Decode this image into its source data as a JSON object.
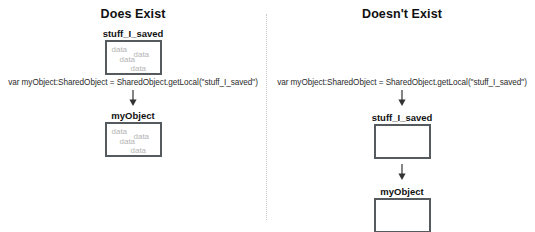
{
  "diagram": {
    "type": "flow-diagram",
    "divider": "vertical-dotted-line",
    "columns": [
      {
        "id": "does-exist",
        "title": "Does Exist",
        "code_line": "var myObject:SharedObject = SharedObject.getLocal(\"stuff_I_saved\")",
        "arrows": 1,
        "nodes": [
          {
            "label": "stuff_I_saved",
            "filled": true,
            "contents": [
              "data",
              "data",
              "data",
              "data"
            ]
          },
          {
            "label": "myObject",
            "filled": true,
            "contents": [
              "data",
              "data",
              "data",
              "data"
            ]
          }
        ]
      },
      {
        "id": "doesnt-exist",
        "title": "Doesn't Exist",
        "code_line": "var myObject:SharedObject = SharedObject.getLocal(\"stuff_I_saved\")",
        "arrows": 2,
        "nodes": [
          {
            "label": "stuff_I_saved",
            "filled": false,
            "contents": []
          },
          {
            "label": "myObject",
            "filled": false,
            "contents": []
          }
        ]
      }
    ]
  },
  "colors": {
    "box_border": "#555a5e",
    "data_text": "#b4b4b4",
    "title_text": "#111111",
    "code_text": "#2b2b2b",
    "divider": "#c9c9c9",
    "background": "#ffffff"
  }
}
